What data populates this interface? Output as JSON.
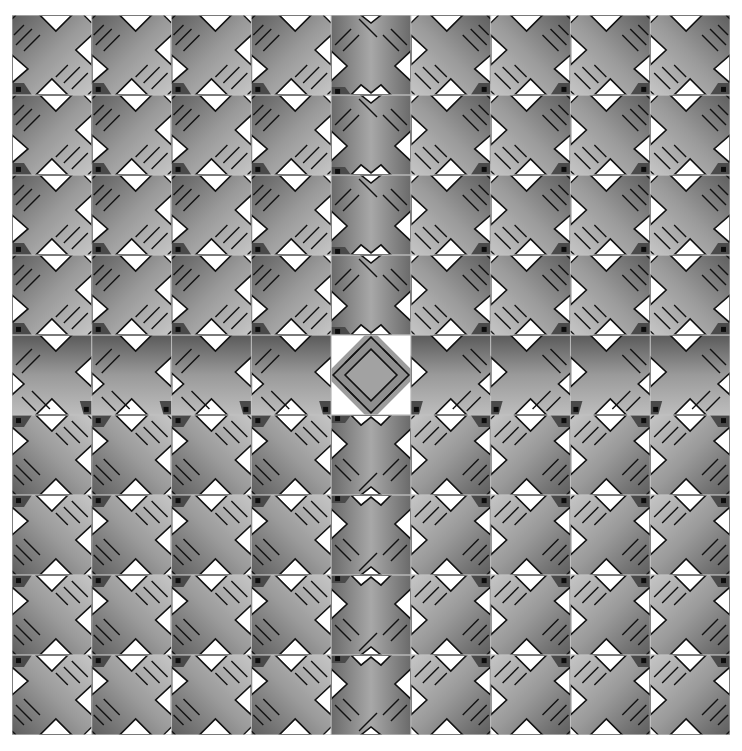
{
  "artwork": {
    "description": "Tiled grayscale geometric pattern of X-shaped tiles with diagonal stripes, mirrored by quadrant around a central diamond tile",
    "grid": {
      "rows": 9,
      "cols": 9,
      "origin_x": 12,
      "origin_y": 15,
      "width": 718,
      "height": 720,
      "tile_gap_color": "#c8c8c8"
    },
    "colors": {
      "background": "#ffffff",
      "shape_light": "#c4c4c4",
      "shape_mid": "#8e8e8e",
      "shape_dark": "#5a5a5a",
      "outline": "#111111",
      "notch": "#ffffff",
      "tile_border": "#bdbdbd"
    },
    "orientations": {
      "top_left": "identity",
      "top_right": "mirror-x",
      "bottom_left": "mirror-y",
      "bottom_right": "rotate-180",
      "middle_column": "symmetric-vertical",
      "middle_row": "symmetric-horizontal",
      "center": "diamond"
    }
  }
}
